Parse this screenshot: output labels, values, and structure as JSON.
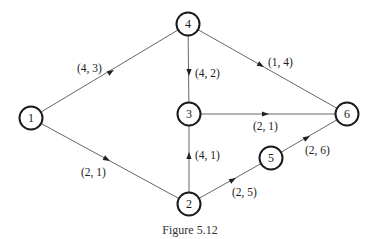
{
  "caption": "Figure 5.12",
  "colors": {
    "node_stroke": "#1a1a1a",
    "edge_stroke": "#555555",
    "text": "#222222",
    "background": "#ffffff"
  },
  "nodes": [
    {
      "id": "1",
      "label": "1",
      "x": 31,
      "y": 118
    },
    {
      "id": "2",
      "label": "2",
      "x": 189,
      "y": 204
    },
    {
      "id": "3",
      "label": "3",
      "x": 189,
      "y": 114
    },
    {
      "id": "4",
      "label": "4",
      "x": 188,
      "y": 24
    },
    {
      "id": "5",
      "label": "5",
      "x": 271,
      "y": 158
    },
    {
      "id": "6",
      "label": "6",
      "x": 347,
      "y": 114
    }
  ],
  "edges": [
    {
      "from": "1",
      "to": "4",
      "label": "(4, 3)"
    },
    {
      "from": "1",
      "to": "2",
      "label": "(2, 1)"
    },
    {
      "from": "4",
      "to": "3",
      "label": "(4, 2)"
    },
    {
      "from": "4",
      "to": "6",
      "label": "(1, 4)"
    },
    {
      "from": "3",
      "to": "6",
      "label": "(2, 1)"
    },
    {
      "from": "2",
      "to": "3",
      "label": "(4, 1)"
    },
    {
      "from": "2",
      "to": "5",
      "label": "(2, 5)"
    },
    {
      "from": "5",
      "to": "6",
      "label": "(2, 6)"
    }
  ]
}
